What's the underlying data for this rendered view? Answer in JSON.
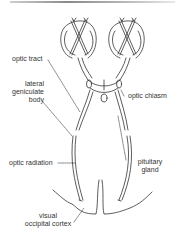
{
  "diagram": {
    "labels": {
      "optic_tract": "optic tract",
      "lateral_geniculate_body": [
        "lateral",
        "geniculate",
        "body"
      ],
      "optic_chiasm": "optic chiasm",
      "pituitary_gland": [
        "pituitary",
        "gland"
      ],
      "optic_radiation": "optic radiation",
      "visual_occipital_cortex": [
        "visual",
        "occipital cortex"
      ]
    },
    "colors": {
      "line": "#333333",
      "background": "#ffffff",
      "text": "#333333"
    }
  }
}
